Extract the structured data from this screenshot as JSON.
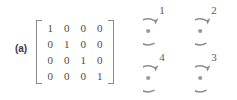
{
  "figure": {
    "panel_label": "(a)",
    "matrix": {
      "name": "identity-matrix-4x4",
      "bracket_style": "square",
      "rows": [
        [
          "1",
          "0",
          "0",
          "0"
        ],
        [
          "0",
          "1",
          "0",
          "0"
        ],
        [
          "0",
          "0",
          "1",
          "0"
        ],
        [
          "0",
          "0",
          "0",
          "1"
        ]
      ]
    },
    "nodes": [
      {
        "label": "1",
        "icon": "circular-arrow-icon",
        "position": "top-left"
      },
      {
        "label": "2",
        "icon": "circular-arrow-icon",
        "position": "top-right"
      },
      {
        "label": "4",
        "icon": "circular-arrow-icon",
        "position": "bottom-left"
      },
      {
        "label": "3",
        "icon": "circular-arrow-icon",
        "position": "bottom-right"
      }
    ],
    "colors": {
      "stroke": "#8a8a8a",
      "digit": "#4a4a4a",
      "label": "#5a5a5a",
      "panel_label": "#3a3a3a",
      "background": "#ffffff"
    }
  }
}
